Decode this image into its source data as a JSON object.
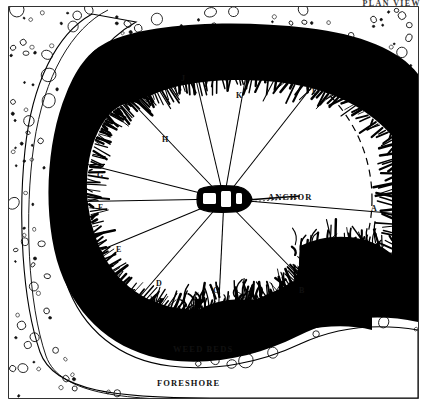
{
  "header": {
    "title": "PLAN VIEW"
  },
  "diagram": {
    "name": "anchorage-swing-plan",
    "captions": [
      {
        "id": "anchor",
        "text": "ANCHOR",
        "x": 268,
        "y": 192
      },
      {
        "id": "weed-beds",
        "text": "WEED BEDS",
        "x": 173,
        "y": 344
      },
      {
        "id": "foreshore",
        "text": "FORESHORE",
        "x": 157,
        "y": 378
      }
    ],
    "bearing_points": [
      {
        "label": "A",
        "x": 371,
        "y": 204,
        "line_x": 413,
        "line_y": 215
      },
      {
        "label": "B",
        "x": 299,
        "y": 286,
        "line_x": 327,
        "line_y": 305
      },
      {
        "label": "C",
        "x": 213,
        "y": 286,
        "line_x": 218,
        "line_y": 320
      },
      {
        "label": "D",
        "x": 156,
        "y": 279,
        "line_x": 131,
        "line_y": 307
      },
      {
        "label": "E",
        "x": 116,
        "y": 245,
        "line_x": 82,
        "line_y": 258
      },
      {
        "label": "F",
        "x": 98,
        "y": 203,
        "line_x": 56,
        "line_y": 202
      },
      {
        "label": "G",
        "x": 97,
        "y": 171,
        "line_x": 58,
        "line_y": 157
      },
      {
        "label": "H",
        "x": 162,
        "y": 135,
        "line_x": 128,
        "line_y": 98
      },
      {
        "label": "J",
        "x": 181,
        "y": 74,
        "line_x": 185,
        "line_y": 33
      },
      {
        "label": "K",
        "x": 236,
        "y": 91,
        "line_x": 251,
        "line_y": 47
      },
      {
        "label": "L",
        "x": 312,
        "y": 87,
        "line_x": 343,
        "line_y": 47
      }
    ],
    "boat": {
      "cx": 224,
      "cy": 199,
      "length": 52,
      "beam": 19
    },
    "colors": {
      "ink": "#000000",
      "paper": "#ffffff",
      "weed": "#000000",
      "shingle_outline": "#1a1a1a"
    }
  }
}
